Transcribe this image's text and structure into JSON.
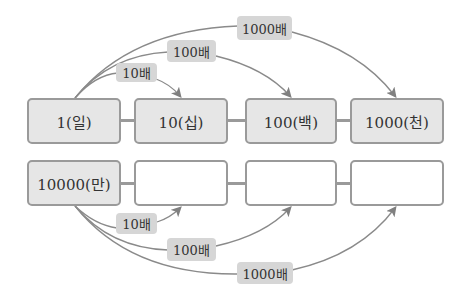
{
  "colors": {
    "box_fill": "#e6e6e6",
    "box_border": "#9a9a9a",
    "tag_fill": "#d6d6d6",
    "arrow": "#808080"
  },
  "top_row": {
    "boxes": [
      {
        "label": "1(일)"
      },
      {
        "label": "10(십)"
      },
      {
        "label": "100(백)"
      },
      {
        "label": "1000(천)"
      }
    ],
    "multipliers": [
      {
        "label": "10배"
      },
      {
        "label": "100배"
      },
      {
        "label": "1000배"
      }
    ]
  },
  "bottom_row": {
    "boxes": [
      {
        "label": "10000(만)"
      },
      {
        "label": ""
      },
      {
        "label": ""
      },
      {
        "label": ""
      }
    ],
    "multipliers": [
      {
        "label": "10배"
      },
      {
        "label": "100배"
      },
      {
        "label": "1000배"
      }
    ]
  }
}
